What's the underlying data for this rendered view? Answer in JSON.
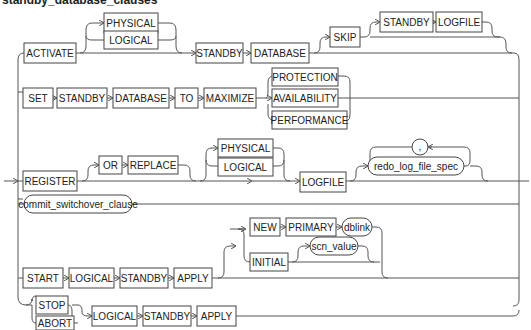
{
  "title": "standby_database_clauses",
  "rows": {
    "activate": {
      "activate": "ACTIVATE",
      "physical": "PHYSICAL",
      "logical": "LOGICAL",
      "standby": "STANDBY",
      "database": "DATABASE",
      "skip": "SKIP",
      "skip_standby": "STANDBY",
      "logfile": "LOGFILE"
    },
    "set": {
      "set": "SET",
      "standby": "STANDBY",
      "database": "DATABASE",
      "to": "TO",
      "maximize": "MAXIMIZE",
      "protection": "PROTECTION",
      "availability": "AVAILABILITY",
      "performance": "PERFORMANCE"
    },
    "register": {
      "register": "REGISTER",
      "or": "OR",
      "replace": "REPLACE",
      "physical": "PHYSICAL",
      "logical": "LOGICAL",
      "logfile": "LOGFILE",
      "separator": ",",
      "redo_log_file_spec": "redo_log_file_spec"
    },
    "commit": {
      "commit_switchover_clause": "commit_switchover_clause"
    },
    "start": {
      "start": "START",
      "logical": "LOGICAL",
      "standby": "STANDBY",
      "apply": "APPLY",
      "new": "NEW",
      "primary": "PRIMARY",
      "dblink": "dblink",
      "initial": "INITIAL",
      "scn_value": "scn_value"
    },
    "stop": {
      "stop": "STOP",
      "abort": "ABORT",
      "logical": "LOGICAL",
      "standby": "STANDBY",
      "apply": "APPLY"
    }
  }
}
